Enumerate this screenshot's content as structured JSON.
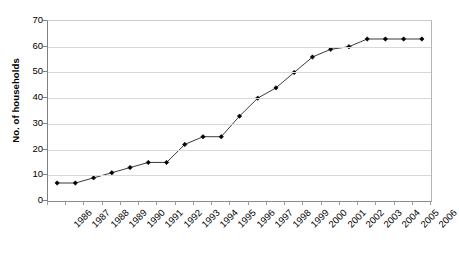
{
  "chart_data": {
    "type": "line",
    "title": "",
    "xlabel": "",
    "ylabel": "No. of households",
    "categories": [
      "1986",
      "1987",
      "1988",
      "1989",
      "1990",
      "1991",
      "1992",
      "1993",
      "1994",
      "1995",
      "1996",
      "1997",
      "1998",
      "1999",
      "2000",
      "2001",
      "2002",
      "2003",
      "2004",
      "2005",
      "2006"
    ],
    "values": [
      7,
      7,
      9,
      11,
      13,
      15,
      15,
      22,
      25,
      25,
      33,
      40,
      44,
      50,
      56,
      59,
      60,
      63,
      63,
      63,
      63
    ],
    "series": [
      {
        "name": "No. of households",
        "values": [
          7,
          7,
          9,
          11,
          13,
          15,
          15,
          22,
          25,
          25,
          33,
          40,
          44,
          50,
          56,
          59,
          60,
          63,
          63,
          63,
          63
        ]
      }
    ],
    "ylim": [
      0,
      70
    ],
    "y_ticks": [
      0,
      10,
      20,
      30,
      40,
      50,
      60,
      70
    ],
    "y_tick_labels": [
      "0",
      "10",
      "20",
      "30",
      "40",
      "50",
      "60",
      "70"
    ],
    "grid": "horizontal",
    "legend": "none",
    "marker": "diamond",
    "line_color": "#3b3b3b",
    "marker_color": "#000000",
    "grid_color": "#d8d8d8",
    "axis_color": "#808080",
    "background_color": "#ffffff",
    "x_tick_label_rotation": -45
  },
  "axes": {
    "y_title": "No. of households"
  }
}
